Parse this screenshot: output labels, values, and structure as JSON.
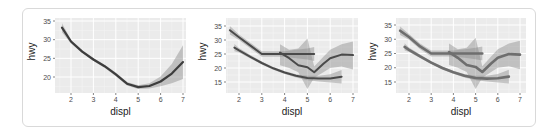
{
  "chart_data": [
    {
      "type": "line",
      "title": "",
      "xlabel": "displ",
      "ylabel": "hwy",
      "xlim": [
        1.6,
        7.0
      ],
      "ylim": [
        16.5,
        35.5
      ],
      "x_ticks": [
        2,
        3,
        4,
        5,
        6,
        7
      ],
      "y_ticks": [
        20,
        25,
        30,
        35
      ],
      "grid": true,
      "legend": "none",
      "series": [
        {
          "name": "loess fit (all)",
          "x": [
            1.6,
            2.0,
            2.5,
            3.0,
            3.5,
            4.0,
            4.5,
            5.0,
            5.5,
            6.0,
            6.5,
            7.0
          ],
          "values": [
            33.2,
            29.5,
            26.8,
            24.7,
            22.9,
            20.7,
            18.2,
            17.3,
            17.6,
            18.8,
            20.9,
            24.0
          ],
          "ci_lower": [
            32.0,
            29.0,
            26.4,
            24.3,
            22.5,
            20.2,
            17.7,
            16.8,
            16.9,
            17.5,
            18.3,
            19.5
          ],
          "ci_upper": [
            34.4,
            30.0,
            27.2,
            25.1,
            23.3,
            21.2,
            18.7,
            17.8,
            18.3,
            20.1,
            23.5,
            28.5
          ]
        }
      ]
    },
    {
      "type": "line",
      "title": "",
      "xlabel": "displ",
      "ylabel": "hwy",
      "xlim": [
        1.6,
        7.0
      ],
      "ylim": [
        12.0,
        36.0
      ],
      "x_ticks": [
        2,
        3,
        4,
        5,
        6,
        7
      ],
      "y_ticks": [
        15,
        20,
        25,
        30,
        35
      ],
      "grid": true,
      "legend": "none",
      "series": [
        {
          "name": "group 1",
          "x": [
            1.8,
            2.0,
            2.5,
            3.0,
            3.5,
            4.0,
            4.5,
            5.0,
            5.5,
            6.0,
            6.5
          ],
          "values": [
            27.3,
            26.3,
            24.0,
            21.8,
            19.9,
            18.4,
            17.2,
            16.4,
            16.2,
            16.3,
            16.9
          ],
          "ci_lower": [
            26.0,
            25.5,
            23.4,
            21.3,
            19.4,
            17.9,
            16.6,
            15.6,
            15.2,
            14.8,
            14.5
          ],
          "ci_upper": [
            28.6,
            27.1,
            24.6,
            22.3,
            20.4,
            18.9,
            17.8,
            17.2,
            17.2,
            17.8,
            19.3
          ]
        },
        {
          "name": "group 2",
          "x": [
            1.6,
            2.0,
            2.5,
            3.0,
            3.5,
            4.0,
            4.5,
            5.0,
            5.3
          ],
          "values": [
            33.5,
            31.0,
            28.0,
            25.0,
            25.0,
            25.0,
            25.0,
            25.0,
            25.0
          ],
          "ci_lower": [
            32.0,
            30.0,
            27.0,
            24.0,
            24.0,
            24.0,
            23.5,
            23.0,
            22.5
          ],
          "ci_upper": [
            35.0,
            32.0,
            29.0,
            26.0,
            26.0,
            26.0,
            26.5,
            27.0,
            27.5
          ]
        },
        {
          "name": "group 3",
          "x": [
            3.8,
            4.2,
            4.6,
            5.0,
            5.3,
            5.7,
            6.0,
            6.5,
            7.0
          ],
          "values": [
            25.5,
            23.5,
            21.0,
            20.3,
            18.5,
            21.5,
            23.5,
            24.8,
            24.6
          ],
          "ci_lower": [
            21.0,
            20.0,
            18.5,
            12.5,
            16.5,
            18.5,
            20.0,
            20.5,
            19.5
          ],
          "ci_upper": [
            28.5,
            26.5,
            27.0,
            30.5,
            20.5,
            24.0,
            26.5,
            28.5,
            29.5
          ]
        }
      ]
    },
    {
      "type": "line",
      "title": "",
      "xlabel": "displ",
      "ylabel": "hwy",
      "xlim": [
        1.6,
        7.0
      ],
      "ylim": [
        12.0,
        36.0
      ],
      "x_ticks": [
        2,
        3,
        4,
        5,
        6,
        7
      ],
      "y_ticks": [
        15,
        20,
        25,
        30,
        35
      ],
      "grid": true,
      "legend": "none",
      "series": [
        {
          "name": "group 1",
          "x": [
            1.8,
            2.0,
            2.5,
            3.0,
            3.5,
            4.0,
            4.5,
            5.0,
            5.5,
            6.0,
            6.5
          ],
          "values": [
            27.3,
            26.3,
            24.0,
            21.8,
            19.9,
            18.4,
            17.2,
            16.4,
            16.2,
            16.3,
            16.9
          ],
          "ci_lower": [
            26.0,
            25.5,
            23.4,
            21.3,
            19.4,
            17.9,
            16.6,
            15.6,
            15.2,
            14.8,
            14.5
          ],
          "ci_upper": [
            28.6,
            27.1,
            24.6,
            22.3,
            20.4,
            18.9,
            17.8,
            17.2,
            17.2,
            17.8,
            19.3
          ]
        },
        {
          "name": "group 2",
          "x": [
            1.6,
            2.0,
            2.5,
            3.0,
            3.5,
            4.0,
            4.5,
            5.0,
            5.3
          ],
          "values": [
            33.0,
            30.8,
            27.5,
            25.0,
            25.0,
            25.0,
            25.0,
            25.0,
            25.0
          ],
          "ci_lower": [
            31.5,
            29.8,
            26.5,
            24.0,
            24.0,
            24.0,
            23.5,
            23.0,
            22.5
          ],
          "ci_upper": [
            34.5,
            31.8,
            28.5,
            26.0,
            26.0,
            26.0,
            26.5,
            27.0,
            27.5
          ]
        },
        {
          "name": "group 3",
          "x": [
            3.8,
            4.2,
            4.6,
            5.0,
            5.3,
            5.7,
            6.0,
            6.5,
            7.0
          ],
          "values": [
            25.5,
            23.5,
            21.0,
            20.3,
            18.5,
            21.5,
            23.5,
            24.8,
            24.6
          ],
          "ci_lower": [
            21.0,
            20.0,
            18.5,
            12.5,
            16.5,
            18.5,
            20.0,
            20.5,
            19.5
          ],
          "ci_upper": [
            28.5,
            26.5,
            27.0,
            30.5,
            20.5,
            24.0,
            26.5,
            28.5,
            29.5
          ]
        }
      ]
    }
  ],
  "panels": [
    {
      "xlabel": "displ",
      "ylabel": "hwy",
      "line_color": "#3d3d3d",
      "line_width": 2.2,
      "ribbon_color": "#9a9a9a",
      "ribbon_opacity": 0.55
    },
    {
      "xlabel": "displ",
      "ylabel": "hwy",
      "line_color": "#4a4a4a",
      "line_width": 2.0,
      "ribbon_color": "#8c8c8c",
      "ribbon_opacity": 0.45
    },
    {
      "xlabel": "displ",
      "ylabel": "hwy",
      "line_color": "#6e6e6e",
      "line_width": 2.6,
      "ribbon_color": "#8c8c8c",
      "ribbon_opacity": 0.45
    }
  ],
  "colors": {
    "panel_bg": "#ebebeb",
    "grid_major": "#ffffff",
    "grid_minor": "#f5f5f5",
    "frame_border": "#d9d9d9"
  }
}
